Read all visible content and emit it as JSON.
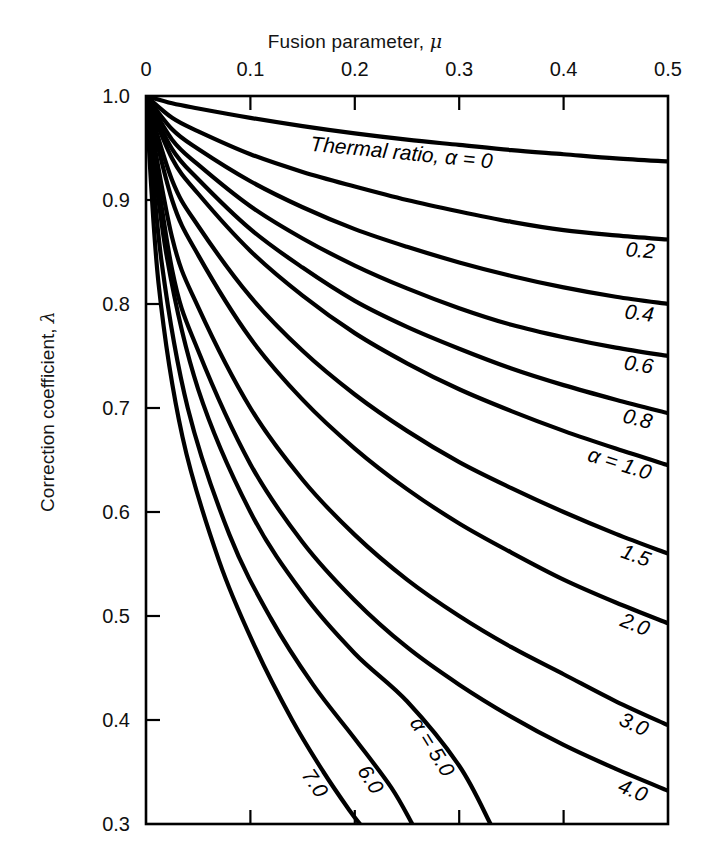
{
  "chart_data": {
    "type": "line",
    "title": "Fusion parameter, μ",
    "xlabel": "Fusion parameter, μ",
    "ylabel": "Correction coefficient, λ",
    "xlim": [
      0,
      0.5
    ],
    "ylim": [
      0.3,
      1.0
    ],
    "grid": false,
    "legend_position": "inline-right",
    "xticks": [
      "0",
      "0.1",
      "0.2",
      "0.3",
      "0.4",
      "0.5"
    ],
    "xtick_values": [
      0,
      0.1,
      0.2,
      0.3,
      0.4,
      0.5
    ],
    "yticks": [
      "1.0",
      "0.9",
      "0.8",
      "0.7",
      "0.6",
      "0.5",
      "0.4",
      "0.3"
    ],
    "ytick_values": [
      1.0,
      0.9,
      0.8,
      0.7,
      0.6,
      0.5,
      0.4,
      0.3
    ],
    "x_axis_position": "top",
    "series_parameter_name": "Thermal ratio, α",
    "series": [
      {
        "name": "0",
        "label": "Thermal ratio, α = 0",
        "label_short": "0",
        "x": [
          0,
          0.025,
          0.05,
          0.1,
          0.15,
          0.2,
          0.25,
          0.3,
          0.35,
          0.4,
          0.45,
          0.5
        ],
        "values": [
          1.0,
          0.993,
          0.988,
          0.979,
          0.971,
          0.964,
          0.958,
          0.953,
          0.948,
          0.944,
          0.94,
          0.937
        ]
      },
      {
        "name": "0.2",
        "label": "0.2",
        "label_short": "0.2",
        "x": [
          0,
          0.025,
          0.05,
          0.1,
          0.15,
          0.2,
          0.25,
          0.3,
          0.35,
          0.4,
          0.45,
          0.5
        ],
        "values": [
          1.0,
          0.979,
          0.966,
          0.944,
          0.927,
          0.913,
          0.9,
          0.889,
          0.879,
          0.871,
          0.866,
          0.862
        ]
      },
      {
        "name": "0.4",
        "label": "0.4",
        "label_short": "0.4",
        "x": [
          0,
          0.025,
          0.05,
          0.1,
          0.15,
          0.2,
          0.25,
          0.3,
          0.35,
          0.4,
          0.45,
          0.5
        ],
        "values": [
          1.0,
          0.968,
          0.949,
          0.918,
          0.893,
          0.872,
          0.855,
          0.84,
          0.827,
          0.816,
          0.807,
          0.8
        ]
      },
      {
        "name": "0.6",
        "label": "0.6",
        "label_short": "0.6",
        "x": [
          0,
          0.025,
          0.05,
          0.1,
          0.15,
          0.2,
          0.25,
          0.3,
          0.35,
          0.4,
          0.45,
          0.5
        ],
        "values": [
          1.0,
          0.958,
          0.934,
          0.894,
          0.863,
          0.837,
          0.815,
          0.796,
          0.78,
          0.768,
          0.758,
          0.75
        ]
      },
      {
        "name": "0.8",
        "label": "0.8",
        "label_short": "0.8",
        "x": [
          0,
          0.025,
          0.05,
          0.1,
          0.15,
          0.2,
          0.25,
          0.3,
          0.35,
          0.4,
          0.45,
          0.5
        ],
        "values": [
          1.0,
          0.949,
          0.92,
          0.872,
          0.835,
          0.803,
          0.778,
          0.757,
          0.738,
          0.722,
          0.708,
          0.695
        ]
      },
      {
        "name": "1.0",
        "label": "α = 1.0",
        "label_short": "1.0",
        "x": [
          0,
          0.025,
          0.05,
          0.1,
          0.15,
          0.2,
          0.25,
          0.3,
          0.35,
          0.4,
          0.45,
          0.5
        ],
        "values": [
          1.0,
          0.94,
          0.906,
          0.851,
          0.808,
          0.772,
          0.743,
          0.718,
          0.697,
          0.678,
          0.661,
          0.645
        ]
      },
      {
        "name": "1.5",
        "label": "1.5",
        "label_short": "1.5",
        "x": [
          0,
          0.025,
          0.05,
          0.1,
          0.15,
          0.2,
          0.25,
          0.3,
          0.35,
          0.4,
          0.45,
          0.5
        ],
        "values": [
          1.0,
          0.919,
          0.875,
          0.807,
          0.755,
          0.713,
          0.678,
          0.648,
          0.623,
          0.6,
          0.579,
          0.56
        ]
      },
      {
        "name": "2.0",
        "label": "2.0",
        "label_short": "2.0",
        "x": [
          0,
          0.025,
          0.05,
          0.1,
          0.15,
          0.2,
          0.25,
          0.3,
          0.35,
          0.4,
          0.45,
          0.5
        ],
        "values": [
          1.0,
          0.9,
          0.847,
          0.767,
          0.708,
          0.661,
          0.622,
          0.589,
          0.561,
          0.535,
          0.513,
          0.493
        ]
      },
      {
        "name": "3.0",
        "label": "3.0",
        "label_short": "3.0",
        "x": [
          0,
          0.025,
          0.05,
          0.1,
          0.15,
          0.2,
          0.25,
          0.3,
          0.35,
          0.4,
          0.45,
          0.5
        ],
        "values": [
          1.0,
          0.864,
          0.797,
          0.7,
          0.631,
          0.578,
          0.535,
          0.5,
          0.47,
          0.444,
          0.418,
          0.395
        ]
      },
      {
        "name": "4.0",
        "label": "4.0",
        "label_short": "4.0",
        "x": [
          0,
          0.025,
          0.05,
          0.1,
          0.15,
          0.2,
          0.25,
          0.3,
          0.35,
          0.4,
          0.45,
          0.5
        ],
        "values": [
          1.0,
          0.833,
          0.755,
          0.646,
          0.571,
          0.515,
          0.47,
          0.434,
          0.403,
          0.376,
          0.353,
          0.332
        ]
      },
      {
        "name": "5.0",
        "label": "α = 5.0",
        "label_short": "5.0",
        "x": [
          0,
          0.02,
          0.05,
          0.1,
          0.15,
          0.2,
          0.25,
          0.3,
          0.33
        ],
        "values": [
          1.0,
          0.845,
          0.718,
          0.6,
          0.522,
          0.464,
          0.418,
          0.356,
          0.3
        ]
      },
      {
        "name": "6.0",
        "label": "6.0",
        "label_short": "6.0",
        "x": [
          0,
          0.015,
          0.04,
          0.08,
          0.12,
          0.16,
          0.2,
          0.235,
          0.255
        ],
        "values": [
          1.0,
          0.84,
          0.7,
          0.578,
          0.497,
          0.434,
          0.382,
          0.335,
          0.3
        ]
      },
      {
        "name": "7.0",
        "label": "7.0",
        "label_short": "7.0",
        "x": [
          0,
          0.012,
          0.035,
          0.07,
          0.105,
          0.14,
          0.17,
          0.195,
          0.205
        ],
        "values": [
          1.0,
          0.82,
          0.672,
          0.553,
          0.469,
          0.4,
          0.35,
          0.313,
          0.3
        ]
      }
    ],
    "annotations": [
      {
        "text": "Thermal ratio, α = 0",
        "series": "0"
      },
      {
        "text": "0.2",
        "series": "0.2"
      },
      {
        "text": "0.4",
        "series": "0.4"
      },
      {
        "text": "0.6",
        "series": "0.6"
      },
      {
        "text": "0.8",
        "series": "0.8"
      },
      {
        "text": "α = 1.0",
        "series": "1.0"
      },
      {
        "text": "1.5",
        "series": "1.5"
      },
      {
        "text": "2.0",
        "series": "2.0"
      },
      {
        "text": "3.0",
        "series": "3.0"
      },
      {
        "text": "4.0",
        "series": "4.0"
      },
      {
        "text": "α = 5.0",
        "series": "5.0"
      },
      {
        "text": "6.0",
        "series": "6.0"
      },
      {
        "text": "7.0",
        "series": "7.0"
      }
    ]
  },
  "axes": {
    "top_title_prefix": "Fusion parameter, ",
    "top_title_symbol": "μ",
    "left_title_prefix": "Correction coefficient, ",
    "left_title_symbol": "λ"
  },
  "labels": {
    "x": [
      "0",
      "0.1",
      "0.2",
      "0.3",
      "0.4",
      "0.5"
    ],
    "y": [
      "1.0",
      "0.9",
      "0.8",
      "0.7",
      "0.6",
      "0.5",
      "0.4",
      "0.3"
    ],
    "curves": [
      "Thermal ratio, α = 0",
      "0.2",
      "0.4",
      "0.6",
      "0.8",
      "α = 1.0",
      "1.5",
      "2.0",
      "3.0",
      "4.0",
      "α = 5.0",
      "6.0",
      "7.0"
    ]
  },
  "colors": {
    "curve": "#000000",
    "axis": "#000000",
    "background": "#ffffff",
    "text": "#111111"
  }
}
